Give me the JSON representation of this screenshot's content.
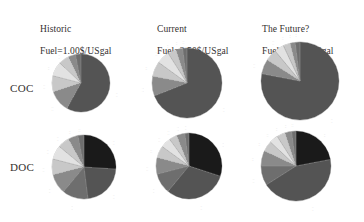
{
  "figure": {
    "background": "#ffffff",
    "row_labels": [
      {
        "key": "coc",
        "text": "COC"
      },
      {
        "key": "doc",
        "text": "DOC"
      }
    ],
    "column_headers": [
      {
        "key": "historic",
        "title": "Historic",
        "fuel": "Fuel=1.00$/USgal"
      },
      {
        "key": "current",
        "title": "Current",
        "fuel": "Fuel=2.50$/USgal"
      },
      {
        "key": "future",
        "title": "The Future?",
        "fuel": "Fuel=4.00$/USgal"
      }
    ]
  },
  "palette": {
    "dark_gray": "#545454",
    "mid_gray": "#6e6e6e",
    "gray": "#8a8a8a",
    "light_gray": "#c8c8c8",
    "pale_gray": "#e2e2e2",
    "near_black": "#1a1a1a",
    "black": "#111111",
    "outline": "#9a9a9a",
    "label_text": "#6e6b69",
    "heading_text": "#33302f"
  },
  "chart_data": [
    {
      "type": "pie",
      "title": "Historic",
      "subtitle": "Fuel=1.00$/USgal",
      "row": "COC",
      "legend_position": "callout-labels",
      "categories": [
        "Fuel",
        "Crew",
        "Maintenance",
        "Navigation",
        "Landing",
        "Insurance",
        "Other"
      ],
      "values": [
        58,
        12,
        9,
        8,
        6,
        4,
        3
      ],
      "colors": [
        "#545454",
        "#8a8a8a",
        "#c8c8c8",
        "#e2e2e2",
        "#c8c8c8",
        "#8a8a8a",
        "#6e6e6e"
      ],
      "labels": [
        {
          "text": "...",
          "value": "..."
        },
        {
          "text": "...",
          "value": "..."
        },
        {
          "text": "...",
          "value": "..."
        },
        {
          "text": "...",
          "value": "..."
        },
        {
          "text": "...",
          "value": "..."
        },
        {
          "text": "...",
          "value": "..."
        },
        {
          "text": "...",
          "value": "..."
        }
      ]
    },
    {
      "type": "pie",
      "title": "Current",
      "subtitle": "Fuel=2.50$/USgal",
      "row": "COC",
      "legend_position": "callout-labels",
      "categories": [
        "Fuel",
        "Crew",
        "Maintenance",
        "Navigation",
        "Landing",
        "Insurance",
        "Other"
      ],
      "values": [
        69,
        9,
        7,
        6,
        4,
        3,
        2
      ],
      "colors": [
        "#545454",
        "#8a8a8a",
        "#c8c8c8",
        "#e2e2e2",
        "#c8c8c8",
        "#8a8a8a",
        "#6e6e6e"
      ],
      "labels": [
        {
          "text": "...",
          "value": "..."
        },
        {
          "text": "...",
          "value": "..."
        },
        {
          "text": "...",
          "value": "..."
        },
        {
          "text": "...",
          "value": "..."
        },
        {
          "text": "...",
          "value": "..."
        },
        {
          "text": "...",
          "value": "..."
        },
        {
          "text": "...",
          "value": "..."
        }
      ]
    },
    {
      "type": "pie",
      "title": "The Future?",
      "subtitle": "Fuel=4.00$/USgal",
      "row": "COC",
      "legend_position": "callout-labels",
      "categories": [
        "Fuel",
        "Crew",
        "Maintenance",
        "Navigation",
        "Landing",
        "Insurance",
        "Other"
      ],
      "values": [
        78,
        6,
        5,
        4,
        3,
        2,
        2
      ],
      "colors": [
        "#545454",
        "#8a8a8a",
        "#c8c8c8",
        "#e2e2e2",
        "#c8c8c8",
        "#8a8a8a",
        "#6e6e6e"
      ],
      "labels": [
        {
          "text": "...",
          "value": "..."
        },
        {
          "text": "...",
          "value": "..."
        },
        {
          "text": "...",
          "value": "..."
        },
        {
          "text": "...",
          "value": "..."
        },
        {
          "text": "...",
          "value": "..."
        },
        {
          "text": "...",
          "value": "..."
        },
        {
          "text": "...",
          "value": "..."
        }
      ]
    },
    {
      "type": "pie",
      "title": "Historic",
      "subtitle": "Fuel=1.00$/USgal",
      "row": "DOC",
      "legend_position": "callout-labels",
      "categories": [
        "Depreciation",
        "Fuel",
        "Crew",
        "Maintenance",
        "Navigation",
        "Landing",
        "Insurance",
        "Interest",
        "Other"
      ],
      "values": [
        26,
        22,
        13,
        10,
        8,
        7,
        6,
        5,
        3
      ],
      "colors": [
        "#1a1a1a",
        "#545454",
        "#6e6e6e",
        "#8a8a8a",
        "#c8c8c8",
        "#e2e2e2",
        "#c8c8c8",
        "#8a8a8a",
        "#6e6e6e"
      ],
      "labels": [
        {
          "text": "...",
          "value": "..."
        },
        {
          "text": "...",
          "value": "..."
        },
        {
          "text": "...",
          "value": "..."
        },
        {
          "text": "...",
          "value": "..."
        },
        {
          "text": "...",
          "value": "..."
        },
        {
          "text": "...",
          "value": "..."
        },
        {
          "text": "...",
          "value": "..."
        },
        {
          "text": "...",
          "value": "..."
        },
        {
          "text": "...",
          "value": "..."
        }
      ]
    },
    {
      "type": "pie",
      "title": "Current",
      "subtitle": "Fuel=2.50$/USgal",
      "row": "DOC",
      "legend_position": "callout-labels",
      "categories": [
        "Depreciation",
        "Fuel",
        "Crew",
        "Maintenance",
        "Navigation",
        "Landing",
        "Insurance",
        "Interest",
        "Other"
      ],
      "values": [
        30,
        31,
        10,
        8,
        6,
        5,
        4,
        4,
        2
      ],
      "colors": [
        "#1a1a1a",
        "#545454",
        "#6e6e6e",
        "#8a8a8a",
        "#c8c8c8",
        "#e2e2e2",
        "#c8c8c8",
        "#8a8a8a",
        "#6e6e6e"
      ],
      "labels": [
        {
          "text": "...",
          "value": "..."
        },
        {
          "text": "...",
          "value": "..."
        },
        {
          "text": "...",
          "value": "..."
        },
        {
          "text": "...",
          "value": "..."
        },
        {
          "text": "...",
          "value": "..."
        },
        {
          "text": "...",
          "value": "..."
        },
        {
          "text": "...",
          "value": "..."
        },
        {
          "text": "...",
          "value": "..."
        },
        {
          "text": "...",
          "value": "..."
        }
      ]
    },
    {
      "type": "pie",
      "title": "The Future?",
      "subtitle": "Fuel=4.00$/USgal",
      "row": "DOC",
      "legend_position": "callout-labels",
      "categories": [
        "Depreciation",
        "Fuel",
        "Crew",
        "Maintenance",
        "Navigation",
        "Landing",
        "Insurance",
        "Interest",
        "Other"
      ],
      "values": [
        22,
        44,
        9,
        7,
        5,
        4,
        4,
        3,
        2
      ],
      "colors": [
        "#1a1a1a",
        "#545454",
        "#6e6e6e",
        "#8a8a8a",
        "#c8c8c8",
        "#e2e2e2",
        "#c8c8c8",
        "#8a8a8a",
        "#6e6e6e"
      ],
      "labels": [
        {
          "text": "...",
          "value": "..."
        },
        {
          "text": "...",
          "value": "..."
        },
        {
          "text": "...",
          "value": "..."
        },
        {
          "text": "...",
          "value": "..."
        },
        {
          "text": "...",
          "value": "..."
        },
        {
          "text": "...",
          "value": "..."
        },
        {
          "text": "...",
          "value": "..."
        },
        {
          "text": "...",
          "value": "..."
        },
        {
          "text": "...",
          "value": "..."
        }
      ]
    }
  ]
}
